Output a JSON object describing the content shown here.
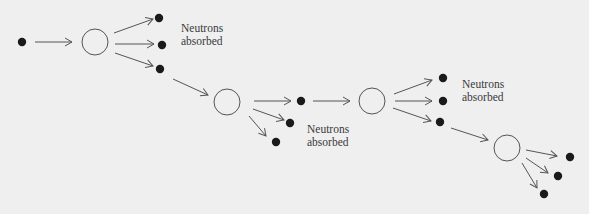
{
  "colors": {
    "background": "#efefef",
    "line": "#555555",
    "neutron": "#1a1a1a"
  },
  "labels": [
    {
      "line1": "Neutrons",
      "line2": "absorbed"
    },
    {
      "line1": "Neutrons",
      "line2": "absorbed"
    },
    {
      "line1": "Neutrons",
      "line2": "absorbed"
    }
  ],
  "diagram": {
    "nodes": [
      {
        "type": "neutron",
        "x": 22,
        "y": 42
      },
      {
        "type": "nucleus",
        "x": 95,
        "y": 42
      },
      {
        "type": "neutron",
        "x": 159,
        "y": 18
      },
      {
        "type": "neutron",
        "x": 162,
        "y": 45
      },
      {
        "type": "neutron",
        "x": 160,
        "y": 69
      },
      {
        "type": "nucleus",
        "x": 227,
        "y": 102
      },
      {
        "type": "neutron",
        "x": 301,
        "y": 101
      },
      {
        "type": "neutron",
        "x": 290,
        "y": 123
      },
      {
        "type": "neutron",
        "x": 276,
        "y": 142
      },
      {
        "type": "nucleus",
        "x": 372,
        "y": 101
      },
      {
        "type": "neutron",
        "x": 443,
        "y": 78
      },
      {
        "type": "neutron",
        "x": 443,
        "y": 101
      },
      {
        "type": "neutron",
        "x": 440,
        "y": 122
      },
      {
        "type": "nucleus",
        "x": 507,
        "y": 148
      },
      {
        "type": "neutron",
        "x": 570,
        "y": 157
      },
      {
        "type": "neutron",
        "x": 558,
        "y": 176
      },
      {
        "type": "neutron",
        "x": 544,
        "y": 194
      }
    ]
  }
}
